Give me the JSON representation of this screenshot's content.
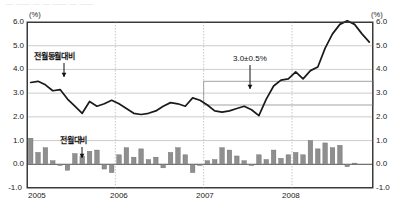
{
  "header": {
    "cutoff_text": "— ——  — — —— — ——"
  },
  "axis": {
    "unit_left": "(%)",
    "unit_right": "(%)",
    "yticks": [
      "6.0",
      "5.0",
      "4.0",
      "3.0",
      "2.0",
      "1.0",
      "0.0",
      "-1.0"
    ],
    "xticks": [
      "2005",
      "2006",
      "2007",
      "2008"
    ]
  },
  "annotations": {
    "yoy_label": "전월동월대비",
    "mom_label": "전월대비",
    "target_band_label": "3.0±0.5%"
  },
  "colors": {
    "line": "#1a1a1a",
    "bar": "#8f8f8f",
    "bar_edge": "#6a6a6a",
    "grid": "#9a9a9a",
    "axis": "#3a3a3a",
    "band_edge": "#9a9a9a",
    "year_divider": "#b0b0b0"
  },
  "chart_data": {
    "type": "line",
    "title": "",
    "subtitle": "",
    "xlabel": "",
    "ylabel": "(%)",
    "ylim": [
      -1.0,
      6.0
    ],
    "grid": true,
    "legend": "inline-annotations",
    "x": [
      "2005-01",
      "2005-02",
      "2005-03",
      "2005-04",
      "2005-05",
      "2005-06",
      "2005-07",
      "2005-08",
      "2005-09",
      "2005-10",
      "2005-11",
      "2005-12",
      "2006-01",
      "2006-02",
      "2006-03",
      "2006-04",
      "2006-05",
      "2006-06",
      "2006-07",
      "2006-08",
      "2006-09",
      "2006-10",
      "2006-11",
      "2006-12",
      "2007-01",
      "2007-02",
      "2007-03",
      "2007-04",
      "2007-05",
      "2007-06",
      "2007-07",
      "2007-08",
      "2007-09",
      "2007-10",
      "2007-11",
      "2007-12",
      "2008-01",
      "2008-02",
      "2008-03",
      "2008-04",
      "2008-05",
      "2008-06",
      "2008-07",
      "2008-08",
      "2008-09",
      "2008-10",
      "2008-11"
    ],
    "series": [
      {
        "name": "전월동월대비",
        "type": "line",
        "axis": "left",
        "values": [
          3.45,
          3.5,
          3.35,
          3.1,
          3.15,
          2.75,
          2.45,
          2.15,
          2.65,
          2.45,
          2.55,
          2.7,
          2.55,
          2.35,
          2.15,
          2.1,
          2.15,
          2.25,
          2.45,
          2.6,
          2.55,
          2.45,
          2.8,
          2.7,
          2.5,
          2.25,
          2.2,
          2.25,
          2.35,
          2.45,
          2.3,
          2.05,
          2.75,
          3.3,
          3.55,
          3.6,
          3.9,
          3.6,
          3.95,
          4.1,
          4.9,
          5.5,
          5.9,
          6.05,
          5.9,
          5.5,
          5.15
        ]
      },
      {
        "name": "전월대비",
        "type": "bar",
        "axis": "left",
        "values": [
          1.1,
          0.5,
          0.7,
          0.15,
          -0.05,
          -0.25,
          0.45,
          0.35,
          0.55,
          0.6,
          -0.2,
          -0.35,
          0.4,
          0.7,
          0.3,
          0.65,
          0.2,
          0.3,
          -0.15,
          0.5,
          0.7,
          0.4,
          -0.35,
          -0.05,
          0.15,
          0.2,
          0.7,
          0.6,
          0.35,
          0.15,
          -0.05,
          0.4,
          0.2,
          0.6,
          0.25,
          0.4,
          0.5,
          0.4,
          1.0,
          0.65,
          0.9,
          0.7,
          0.8,
          -0.1,
          0.05,
          0.0,
          0.0
        ]
      }
    ],
    "target_band": {
      "label": "3.0±0.5%",
      "center": 3.0,
      "lower": 2.5,
      "upper": 3.5,
      "start": "2007-01",
      "end": "2008-11"
    }
  }
}
